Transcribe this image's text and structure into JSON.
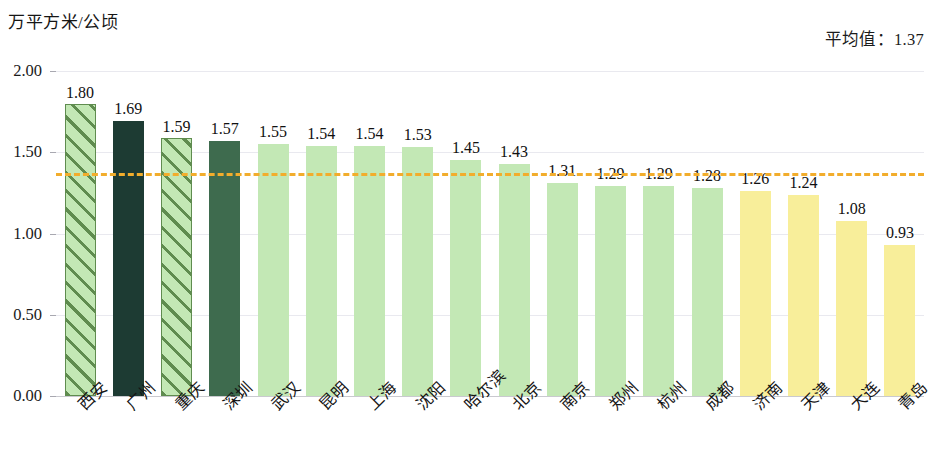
{
  "axis_unit_title": "万平方米/公顷",
  "average_label": "平均值：1.37",
  "y_ticks": [
    "0.00",
    "0.50",
    "1.00",
    "1.50",
    "2.00"
  ],
  "colors": {
    "bar_light_green": "#c3e8b5",
    "bar_hatch_stripe": "#5f8c4f",
    "bar_dark_teal": "#1d3b33",
    "bar_dark_green": "#3e6b4e",
    "bar_yellow": "#f8ee9a",
    "average_line": "#f2ad2c",
    "gridline": "#e9e9ef",
    "axis": "#c9c9cf"
  },
  "chart_data": {
    "type": "bar",
    "title": "",
    "subtitle": "",
    "xlabel": "",
    "ylabel": "万平方米/公顷",
    "ylim": [
      0,
      2.0
    ],
    "ytick_values": [
      0,
      0.5,
      1.0,
      1.5,
      2.0
    ],
    "grid": true,
    "legend": "none",
    "categories": [
      "西安",
      "广州",
      "重庆",
      "深圳",
      "武汉",
      "昆明",
      "上海",
      "沈阳",
      "哈尔滨",
      "北京",
      "南京",
      "郑州",
      "杭州",
      "成都",
      "济南",
      "天津",
      "大连",
      "青岛"
    ],
    "values": [
      1.8,
      1.69,
      1.59,
      1.57,
      1.55,
      1.54,
      1.54,
      1.53,
      1.45,
      1.43,
      1.31,
      1.29,
      1.29,
      1.28,
      1.26,
      1.24,
      1.08,
      0.93
    ],
    "value_labels": [
      "1.80",
      "1.69",
      "1.59",
      "1.57",
      "1.55",
      "1.54",
      "1.54",
      "1.53",
      "1.45",
      "1.43",
      "1.31",
      "1.29",
      "1.29",
      "1.28",
      "1.26",
      "1.24",
      "1.08",
      "0.93"
    ],
    "bar_styles": [
      "hatched-green",
      "solid-dark-teal",
      "hatched-green",
      "solid-dark-green",
      "solid-light-green",
      "solid-light-green",
      "solid-light-green",
      "solid-light-green",
      "solid-light-green",
      "solid-light-green",
      "solid-light-green",
      "solid-light-green",
      "solid-light-green",
      "solid-light-green",
      "solid-yellow",
      "solid-yellow",
      "solid-yellow",
      "solid-yellow"
    ],
    "annotations": [
      {
        "name": "average-line",
        "type": "hline",
        "value": 1.37,
        "label": "平均值：1.37",
        "style": "dashed",
        "color": "#f2ad2c"
      }
    ]
  }
}
